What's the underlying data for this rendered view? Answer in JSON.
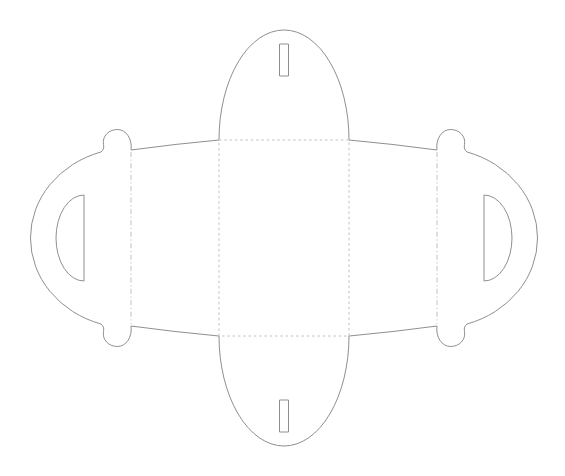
{
  "diagram": {
    "viewbox": "0 0 565 476",
    "canvas": {
      "width": "565",
      "height": "476"
    },
    "colors": {
      "background": "#ffffff",
      "cut_line": "#8f8f8f",
      "fold_line": "#c0c0c0"
    },
    "styles": {
      "cut_dash": "none",
      "base_rect_dash": "2.5 2.8",
      "side_fold_dash": "5 2.6 1.2 2.6"
    },
    "paths": {
      "outline": "M 219 140 A 65 110 0 0 1 349 140 Q 393 144 437 150 C 435.5 139.5 441.5 129.5 450.5 129.5 C 459.5 129.5 466 136.5 464.5 144.5 Q 463.5 149.5 467 152 A 100 90 0 0 1 467 324 Q 463.5 326.5 464.5 331.5 C 466 339.5 459.5 346.5 450.5 346.5 C 441.5 346.5 435.5 336.5 437 326 Q 393 332 349 336 A 65 110 0 0 1 219 336 Q 175 332 131 326 C 132.5 336.5 126.5 346.5 117.5 346.5 C 108.5 346.5 102 339.5 103.5 331.5 Q 104.5 326.5 101 324 A 100 90 0 0 1 101 152 Q 104.5 149.5 103.5 144.5 C 102 136.5 108.5 129.5 117.5 129.5 C 126.5 129.5 132.5 139.5 131 150 Q 175 144 219 140 Z",
      "handle_cutout_left": "M 84 195 L 84 281 A 28 43 0 0 1 84 195 Z",
      "handle_cutout_right": "M 484 195 L 484 281 A 28 43 0 0 0 484 195 Z",
      "slot_top": "M 279.5 44 h 9 v 32 h -9 Z",
      "slot_bottom": "M 279.5 400 h 9 v 32 h -9 Z",
      "fold_base_rect": "M 219 140 H 349 V 336 H 219 Z",
      "fold_left": "M 131 152 V 324",
      "fold_right": "M 437 152 V 324"
    }
  }
}
